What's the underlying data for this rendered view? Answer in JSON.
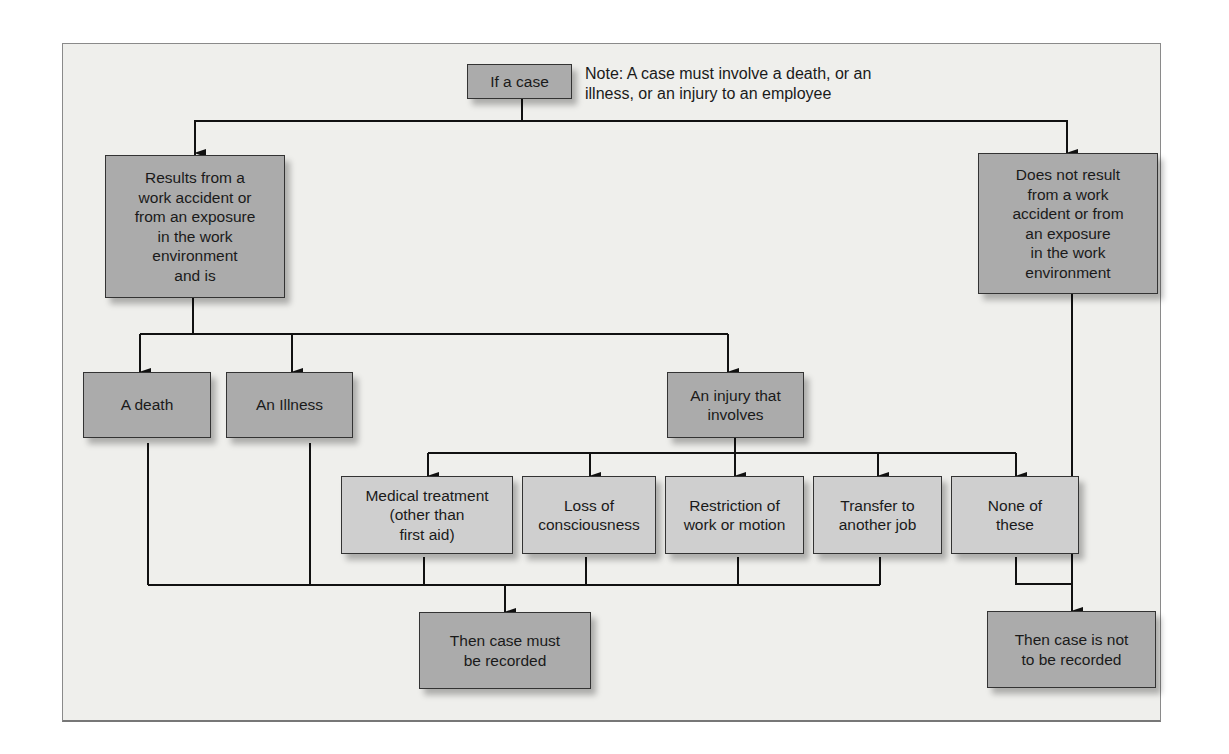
{
  "diagram": {
    "start": {
      "label": "If a case"
    },
    "note": "Note: A case must involve a death, or an\nillness, or an injury to an employee",
    "branches": {
      "work_related": {
        "label": "Results from a\nwork accident or\nfrom  an exposure\nin the work\nenvironment\nand is"
      },
      "not_work_related": {
        "label": "Does not result\nfrom a work\naccident or from\nan exposure\nin the work\nenvironment"
      }
    },
    "case_types": [
      {
        "label": "A death"
      },
      {
        "label": "An Illness"
      },
      {
        "label": "An injury that\ninvolves"
      }
    ],
    "injury_outcomes": [
      {
        "label": "Medical treatment\n(other than\nfirst aid)"
      },
      {
        "label": "Loss of\nconsciousness"
      },
      {
        "label": "Restriction of\nwork or motion"
      },
      {
        "label": "Transfer to\nanother job"
      },
      {
        "label": "None of\nthese"
      }
    ],
    "results": {
      "recorded": {
        "label": "Then case must\nbe recorded"
      },
      "not_recorded": {
        "label": "Then case is not\nto be recorded"
      }
    },
    "colors": {
      "primary_box": "#ababab",
      "secondary_box": "#cfcfcf",
      "background": "#efefec",
      "line": "#111111"
    }
  }
}
